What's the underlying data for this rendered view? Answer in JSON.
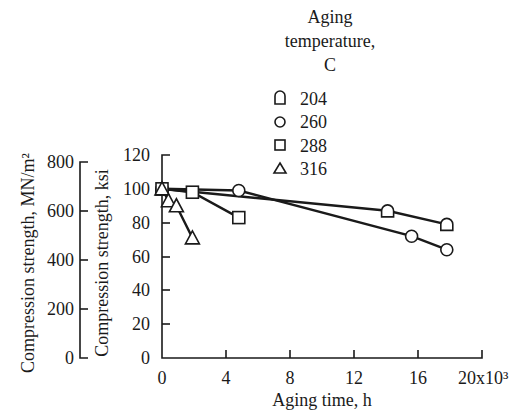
{
  "chart_data": {
    "type": "line",
    "title": "",
    "xlabel": "Aging time, h",
    "x_tick_labels": [
      "0",
      "4",
      "8",
      "12",
      "16",
      "20x10³"
    ],
    "x_ticks": [
      0,
      4,
      8,
      12,
      16,
      20
    ],
    "x_multiplier": "x10³",
    "xlim": [
      0,
      20
    ],
    "ylabel": "Compression strength, ksi",
    "y_ticks": [
      0,
      20,
      40,
      60,
      80,
      100,
      120
    ],
    "ylim": [
      0,
      120
    ],
    "ylabel_secondary": "Compression strength, MN/m²",
    "y_ticks_secondary": [
      0,
      200,
      400,
      600,
      800
    ],
    "legend": {
      "title_lines": [
        "Aging",
        "temperature,",
        "C"
      ],
      "position": "top-right, above plot"
    },
    "grid": false,
    "series": [
      {
        "name": "204",
        "marker": "dome",
        "points": [
          [
            0,
            100
          ],
          [
            14.1,
            87
          ],
          [
            17.8,
            79
          ]
        ]
      },
      {
        "name": "260",
        "marker": "circle",
        "points": [
          [
            0,
            100
          ],
          [
            4.8,
            99
          ],
          [
            15.6,
            72
          ],
          [
            17.8,
            64
          ]
        ]
      },
      {
        "name": "288",
        "marker": "square",
        "points": [
          [
            0,
            100
          ],
          [
            1.9,
            98
          ],
          [
            4.8,
            83
          ]
        ]
      },
      {
        "name": "316",
        "marker": "triangle",
        "points": [
          [
            0,
            100
          ],
          [
            0.4,
            93
          ],
          [
            0.9,
            90
          ],
          [
            1.9,
            71
          ]
        ]
      }
    ]
  }
}
